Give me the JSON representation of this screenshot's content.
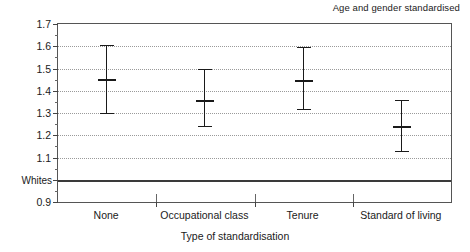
{
  "chart_data": {
    "type": "scatter",
    "title": "Age and gender standardised",
    "xlabel": "Type of standardisation",
    "ylabel": "",
    "ylim": [
      0.9,
      1.7
    ],
    "ytick_labels": [
      "1.7",
      "1.6",
      "1.5",
      "1.4",
      "1.3",
      "1.2",
      "1.1",
      "Whites",
      "0.9"
    ],
    "ytick_values": [
      1.7,
      1.6,
      1.5,
      1.4,
      1.3,
      1.2,
      1.1,
      1.0,
      0.9
    ],
    "reference_line": {
      "label": "Whites",
      "value": 1.0
    },
    "grid": "horizontal dotted at 1.1,1.2,1.3,1.4,1.5,1.6",
    "legend": "none",
    "categories": [
      "None",
      "Occupational class",
      "Tenure",
      "Standard of living"
    ],
    "series": [
      {
        "name": "Mortality ratio",
        "values": [
          1.455,
          1.36,
          1.45,
          1.24
        ],
        "ci_lower": [
          1.3,
          1.24,
          1.32,
          1.13
        ],
        "ci_upper": [
          1.605,
          1.5,
          1.595,
          1.36
        ]
      }
    ],
    "points": [
      {
        "category": "None",
        "estimate": "1.455",
        "lower": "1.30",
        "upper": "1.605"
      },
      {
        "category": "Occupational class",
        "estimate": "1.36",
        "lower": "1.24",
        "upper": "1.50"
      },
      {
        "category": "Tenure",
        "estimate": "1.45",
        "lower": "1.32",
        "upper": "1.595"
      },
      {
        "category": "Standard of living",
        "estimate": "1.24",
        "lower": "1.13",
        "upper": "1.36"
      }
    ]
  },
  "colors": {
    "marker": "#1a1a1a",
    "frame": "#555555",
    "grid": "#9a9a9a",
    "reference": "#3a3a3a",
    "background": "#ffffff"
  }
}
